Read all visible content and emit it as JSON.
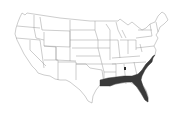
{
  "map": {
    "subject": "Contiguous United States",
    "style": "state outlines, grayscale",
    "background_color": "#ffffff",
    "outline_color": "#9a9a9a",
    "highlight_color": "#3a3a3a",
    "highlighted_region": {
      "label": "Southeastern coastal plain",
      "states_touched": [
        "Louisiana",
        "Mississippi",
        "Alabama",
        "Georgia",
        "Florida",
        "South Carolina",
        "North Carolina"
      ]
    },
    "marker": {
      "description": "small dark spot",
      "approx_location": "Tennessee / northern Alabama"
    }
  }
}
